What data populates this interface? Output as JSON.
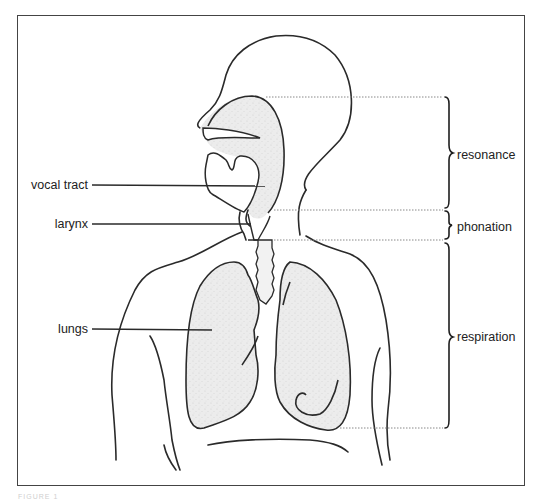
{
  "figure": {
    "left_labels": [
      {
        "id": "vocal-tract",
        "text": "vocal tract"
      },
      {
        "id": "larynx",
        "text": "larynx"
      },
      {
        "id": "lungs",
        "text": "lungs"
      }
    ],
    "bracket_labels": [
      {
        "id": "resonance",
        "text": "resonance"
      },
      {
        "id": "phonation",
        "text": "phonation"
      },
      {
        "id": "respiration",
        "text": "respiration"
      }
    ],
    "caption": "FIGURE 1"
  },
  "colors": {
    "outline": "#2a2a2a",
    "shade": "#e9e9e9",
    "frame": "#444444",
    "dotted": "#888888",
    "text": "#222222"
  }
}
